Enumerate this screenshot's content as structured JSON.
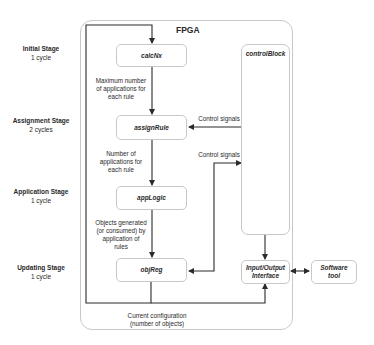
{
  "diagram": {
    "container": {
      "label": "FPGA"
    },
    "stages": [
      {
        "name": "Initial Stage",
        "cycles": "1 cycle"
      },
      {
        "name": "Assignment Stage",
        "cycles": "2 cycles"
      },
      {
        "name": "Application Stage",
        "cycles": "1 cycle"
      },
      {
        "name": "Updating Stage",
        "cycles": "1 cycle"
      }
    ],
    "blocks": {
      "calcNx": "calcNx",
      "assignRule": "assignRule",
      "appLogic": "appLogic",
      "objReg": "objReg",
      "controlBlock": "controlBlock",
      "io_line1": "Input/Output",
      "io_line2": "Interface",
      "sw_line1": "Software",
      "sw_line2": "tool"
    },
    "edge_labels": {
      "calc_to_assign": [
        "Maximum number",
        "of applications for",
        "each rule"
      ],
      "assign_to_app": [
        "Number of",
        "applications for",
        "each rule"
      ],
      "app_to_obj": [
        "Objects generated",
        "(or consumed) by",
        "application of",
        "rules"
      ],
      "control_1": "Control signals",
      "control_2": "Control signals",
      "feedback": [
        "Current configuration",
        "(number of objects)"
      ]
    },
    "colors": {
      "line": "#2a2a2a",
      "border": "#c8c8c8",
      "background": "#ffffff"
    }
  }
}
